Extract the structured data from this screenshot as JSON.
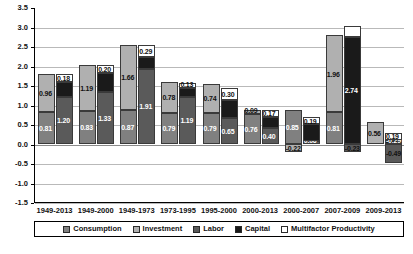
{
  "chart_data": {
    "type": "bar",
    "title": "",
    "subtitle": "",
    "xlabel": "",
    "ylabel": "",
    "ylim": [
      -1.5,
      3.5
    ],
    "ytick_step": 0.5,
    "grid": true,
    "stacked": true,
    "legend_position": "bottom",
    "yticks": [
      "3.5",
      "3.0",
      "2.5",
      "2.0",
      "1.5",
      "1.0",
      "0.5",
      "0.0",
      "-0.5",
      "-1.0",
      "-1.5"
    ],
    "categories": [
      "1949-2013",
      "1949-2000",
      "1949-1973",
      "1973-1995",
      "1995-2000",
      "2000-2013",
      "2000-2007",
      "2007-2009",
      "2009-2013"
    ],
    "legend": [
      {
        "name": "Consumption",
        "color": "#808080"
      },
      {
        "name": "Investment",
        "color": "#b0b0b0"
      },
      {
        "name": "Labor",
        "color": "#5a5a5a"
      },
      {
        "name": "Capital",
        "color": "#1a1a1a"
      },
      {
        "name": "Multifactor Productivity",
        "color": "#ffffff"
      }
    ],
    "series": [
      {
        "name": "Consumption",
        "values": [
          0.81,
          0.83,
          0.87,
          0.79,
          0.79,
          0.76,
          0.85,
          0.81,
          0.0
        ]
      },
      {
        "name": "Investment",
        "values": [
          0.96,
          1.19,
          1.66,
          0.78,
          0.74,
          0.09,
          -0.22,
          1.96,
          0.56
        ]
      },
      {
        "name": "Labor",
        "values": [
          1.2,
          1.33,
          1.91,
          1.19,
          0.65,
          0.4,
          0.06,
          -0.23,
          -0.49
        ]
      },
      {
        "name": "Capital",
        "values": [
          0.39,
          0.49,
          0.32,
          0.24,
          0.47,
          0.28,
          0.43,
          2.74,
          0.09
        ]
      },
      {
        "name": "Multifactor Productivity",
        "values": [
          0.18,
          0.2,
          0.29,
          0.13,
          0.3,
          0.17,
          0.19,
          0.27,
          0.19
        ]
      }
    ],
    "groups": [
      {
        "category": "1949-2013",
        "left_bar": [
          {
            "series": "Consumption",
            "value": 0.81,
            "label": "0.81",
            "label_color": "light"
          },
          {
            "series": "Investment",
            "value": 0.96,
            "label": "0.96",
            "label_color": "dark"
          }
        ],
        "right_bar": [
          {
            "series": "Labor",
            "value": 1.2,
            "label": "1.20",
            "label_color": "light"
          },
          {
            "series": "Capital",
            "value": 0.39,
            "label": "",
            "label_color": "light"
          },
          {
            "series": "Multifactor Productivity",
            "value": 0.18,
            "label": "0.18",
            "label_color": "dark"
          }
        ]
      },
      {
        "category": "1949-2000",
        "left_bar": [
          {
            "series": "Consumption",
            "value": 0.83,
            "label": "0.83",
            "label_color": "light"
          },
          {
            "series": "Investment",
            "value": 1.19,
            "label": "1.19",
            "label_color": "dark"
          }
        ],
        "right_bar": [
          {
            "series": "Labor",
            "value": 1.33,
            "label": "1.33",
            "label_color": "light"
          },
          {
            "series": "Capital",
            "value": 0.49,
            "label": "",
            "label_color": "light"
          },
          {
            "series": "Multifactor Productivity",
            "value": 0.2,
            "label": "0.20",
            "label_color": "dark"
          }
        ]
      },
      {
        "category": "1949-1973",
        "left_bar": [
          {
            "series": "Consumption",
            "value": 0.87,
            "label": "0.87",
            "label_color": "light"
          },
          {
            "series": "Investment",
            "value": 1.66,
            "label": "1.66",
            "label_color": "dark"
          }
        ],
        "right_bar": [
          {
            "series": "Labor",
            "value": 1.91,
            "label": "1.91",
            "label_color": "light"
          },
          {
            "series": "Capital",
            "value": 0.32,
            "label": "",
            "label_color": "light"
          },
          {
            "series": "Multifactor Productivity",
            "value": 0.29,
            "label": "0.29",
            "label_color": "dark"
          }
        ]
      },
      {
        "category": "1973-1995",
        "left_bar": [
          {
            "series": "Consumption",
            "value": 0.79,
            "label": "0.79",
            "label_color": "light"
          },
          {
            "series": "Investment",
            "value": 0.78,
            "label": "0.78",
            "label_color": "dark"
          }
        ],
        "right_bar": [
          {
            "series": "Labor",
            "value": 1.19,
            "label": "1.19",
            "label_color": "light"
          },
          {
            "series": "Capital",
            "value": 0.24,
            "label": "",
            "label_color": "light"
          },
          {
            "series": "Multifactor Productivity",
            "value": 0.13,
            "label": "0.13",
            "label_color": "dark"
          }
        ]
      },
      {
        "category": "1995-2000",
        "left_bar": [
          {
            "series": "Consumption",
            "value": 0.79,
            "label": "0.79",
            "label_color": "light"
          },
          {
            "series": "Investment",
            "value": 0.74,
            "label": "0.74",
            "label_color": "dark"
          }
        ],
        "right_bar": [
          {
            "series": "Labor",
            "value": 0.65,
            "label": "0.65",
            "label_color": "light"
          },
          {
            "series": "Capital",
            "value": 0.47,
            "label": "",
            "label_color": "light"
          },
          {
            "series": "Multifactor Productivity",
            "value": 0.3,
            "label": "0.30",
            "label_color": "dark"
          }
        ]
      },
      {
        "category": "2000-2013",
        "left_bar": [
          {
            "series": "Consumption",
            "value": 0.76,
            "label": "0.76",
            "label_color": "light"
          },
          {
            "series": "Investment",
            "value": 0.09,
            "label": "0.09",
            "label_color": "dark"
          }
        ],
        "right_bar": [
          {
            "series": "Labor",
            "value": 0.4,
            "label": "0.40",
            "label_color": "light"
          },
          {
            "series": "Capital",
            "value": 0.28,
            "label": "",
            "label_color": "light"
          },
          {
            "series": "Multifactor Productivity",
            "value": 0.17,
            "label": "0.17",
            "label_color": "dark"
          }
        ]
      },
      {
        "category": "2000-2007",
        "left_bar": [
          {
            "series": "Consumption",
            "value": 0.85,
            "label": "0.85",
            "label_color": "light"
          },
          {
            "series": "Investment",
            "value": -0.22,
            "label": "-0.22",
            "label_color": "dark"
          }
        ],
        "right_bar": [
          {
            "series": "Labor",
            "value": 0.06,
            "label": "0.06",
            "label_color": "light"
          },
          {
            "series": "Capital",
            "value": 0.43,
            "label": "",
            "label_color": "light"
          },
          {
            "series": "Multifactor Productivity",
            "value": 0.19,
            "label": "0.19",
            "label_color": "dark"
          }
        ]
      },
      {
        "category": "2007-2009",
        "left_bar": [
          {
            "series": "Consumption",
            "value": 0.81,
            "label": "0.81",
            "label_color": "light"
          },
          {
            "series": "Investment",
            "value": 1.96,
            "label": "1.96",
            "label_color": "dark"
          }
        ],
        "right_bar": [
          {
            "series": "Labor",
            "value": -0.23,
            "label": "-0.23",
            "label_color": "dark"
          },
          {
            "series": "Capital",
            "value": 2.74,
            "label": "2.74",
            "label_color": "light"
          },
          {
            "series": "Multifactor Productivity",
            "value": 0.27,
            "label": "",
            "label_color": "dark"
          }
        ]
      },
      {
        "category": "2009-2013",
        "left_bar": [
          {
            "series": "Consumption",
            "value": 0.0,
            "label": "",
            "label_color": "light"
          },
          {
            "series": "Investment",
            "value": 0.56,
            "label": "0.56",
            "label_color": "dark"
          }
        ],
        "right_bar": [
          {
            "series": "Labor",
            "value": -0.49,
            "label": "-0.49",
            "label_color": "dark"
          },
          {
            "series": "Capital",
            "value": 0.09,
            "label": "-0.29",
            "label_color": "light"
          },
          {
            "series": "Multifactor Productivity",
            "value": 0.19,
            "label": "0.19",
            "label_color": "dark"
          }
        ]
      }
    ]
  }
}
